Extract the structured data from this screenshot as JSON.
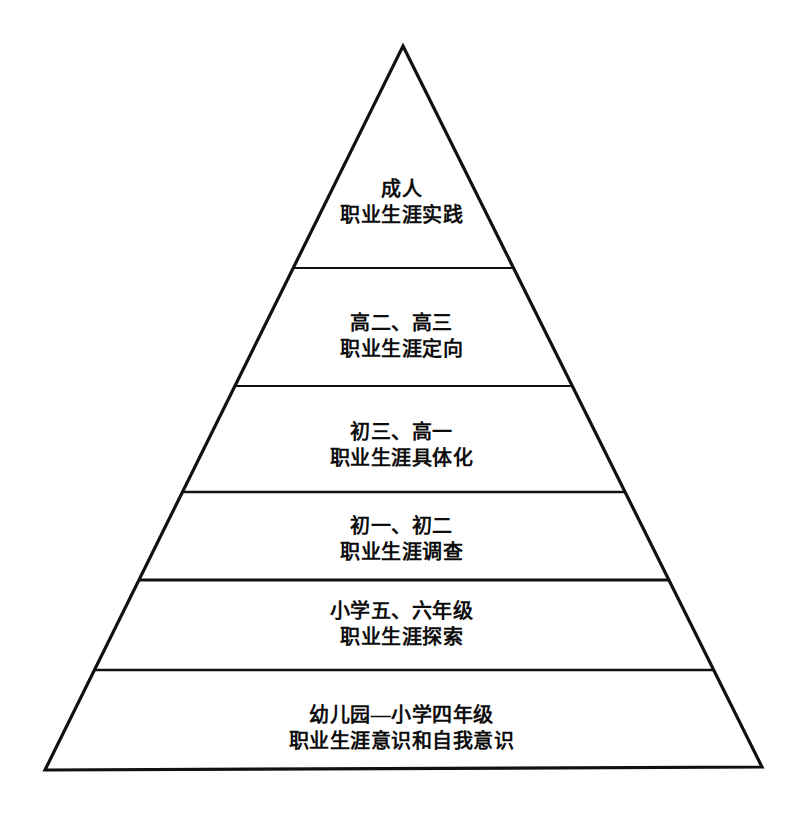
{
  "diagram": {
    "type": "pyramid",
    "title": "",
    "orientation": "apex-top",
    "background_color": "#ffffff",
    "stroke_color": "#111111",
    "text_color": "#0d0d0d",
    "geometry": {
      "apex": [
        403,
        46
      ],
      "base_left": [
        45,
        770
      ],
      "base_right": [
        762,
        767
      ],
      "divider_y": [
        268,
        386,
        492,
        580,
        670
      ]
    },
    "tiers": [
      {
        "index": 0,
        "position": "top",
        "stage": "成人",
        "activity": "职业生涯实践"
      },
      {
        "index": 1,
        "position": "second",
        "stage": "高二、高三",
        "activity": "职业生涯定向"
      },
      {
        "index": 2,
        "position": "third",
        "stage": "初三、高一",
        "activity": "职业生涯具体化"
      },
      {
        "index": 3,
        "position": "fourth",
        "stage": "初一、初二",
        "activity": "职业生涯调查"
      },
      {
        "index": 4,
        "position": "fifth",
        "stage": "小学五、六年级",
        "activity": "职业生涯探索"
      },
      {
        "index": 5,
        "position": "base",
        "stage": "幼儿园—小学四年级",
        "activity": "职业生涯意识和自我意识"
      }
    ]
  }
}
